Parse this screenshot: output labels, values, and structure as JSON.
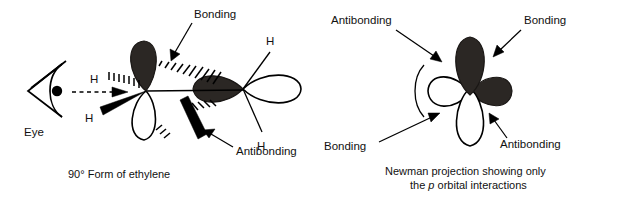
{
  "figure": {
    "background_color": "#ffffff",
    "line_color": "#000000",
    "filled_lobe_color": "#2b2724",
    "empty_lobe_color": "#ffffff"
  },
  "left_panel": {
    "caption": "90° Form of ethylene",
    "eye_label": "Eye",
    "labels": {
      "bonding": "Bonding",
      "antibonding": "Antibonding"
    },
    "hydrogens": [
      "H",
      "H",
      "H",
      "H"
    ],
    "sight_line": "dashed-arrow-from-eye"
  },
  "right_panel": {
    "caption_line1": "Newman projection showing only",
    "caption_line2_pre": "the ",
    "caption_line2_italic": "p",
    "caption_line2_post": " orbital interactions",
    "labels": {
      "antibonding_top_left": "Antibonding",
      "bonding_top_right": "Bonding",
      "bonding_bottom_left": "Bonding",
      "antibonding_bottom_right": "Antibonding"
    }
  }
}
